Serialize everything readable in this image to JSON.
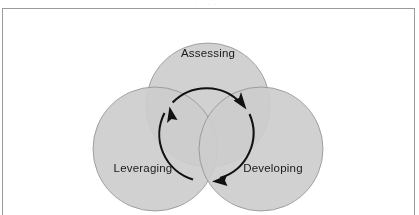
{
  "page": {
    "background_color": "#ffffff",
    "scan_sliver_text": ". . . . ."
  },
  "figure": {
    "frame_color": "#9a9a9a",
    "name": "three-circle-venn-diagram",
    "background_color": "#ffffff"
  },
  "diagram": {
    "type": "venn",
    "circle_count": 3,
    "fill_single": "#cdcdcd",
    "fill_double": "#a8a8a8",
    "fill_triple": "#999999",
    "stroke_color": "#8e8e8e",
    "arrow_color": "#111111",
    "circles": [
      {
        "id": "assessing",
        "label": "Assessing",
        "cx": 205,
        "cy": 96,
        "r": 62,
        "label_x": 205,
        "label_y": 45
      },
      {
        "id": "leveraging",
        "label": "Leveraging",
        "cx": 152,
        "cy": 140,
        "r": 62,
        "label_x": 140,
        "label_y": 160
      },
      {
        "id": "developing",
        "label": "Developing",
        "cx": 258,
        "cy": 140,
        "r": 62,
        "label_x": 270,
        "label_y": 160
      }
    ],
    "cycle": {
      "direction": "clockwise",
      "description": "Assessing to Developing to Leveraging and back to Assessing",
      "arcs": [
        {
          "id": "arc-assessing-to-developing",
          "from": "assessing",
          "to": "developing",
          "arrowhead": "upper-right"
        },
        {
          "id": "arc-developing-to-leveraging",
          "from": "developing",
          "to": "leveraging",
          "arrowhead": "bottom"
        },
        {
          "id": "arc-leveraging-to-assessing",
          "from": "leveraging",
          "to": "assessing",
          "arrowhead": "upper-left"
        }
      ]
    }
  }
}
